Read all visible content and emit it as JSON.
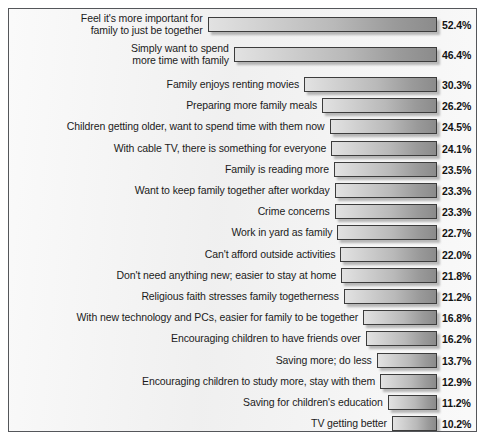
{
  "chart_data": {
    "type": "bar",
    "orientation": "horizontal",
    "title": "",
    "subtitle": "",
    "xlabel": "",
    "ylabel": "",
    "grid": false,
    "legend": null,
    "value_suffix": "%",
    "axis_alignment": "bars right-aligned to common right edge",
    "xlim": [
      0,
      52.4
    ],
    "categories": [
      "Feel it's more important for\nfamily to just be together",
      "Simply want to spend\nmore time with family",
      "Family enjoys renting movies",
      "Preparing more family meals",
      "Children getting older, want to spend time with them now",
      "With cable TV, there is something for everyone",
      "Family is reading more",
      "Want to keep family together after workday",
      "Crime concerns",
      "Work in yard as family",
      "Can't afford outside activities",
      "Don't need anything new; easier to stay at home",
      "Religious faith stresses family togetherness",
      "With new technology and PCs, easier for family to be together",
      "Encouraging children to have friends over",
      "Saving more; do less",
      "Encouraging children to study more, stay with them",
      "Saving for children's education",
      "TV getting better"
    ],
    "values": [
      52.4,
      46.4,
      30.3,
      26.2,
      24.5,
      24.1,
      23.5,
      23.3,
      23.3,
      22.7,
      22.0,
      21.8,
      21.2,
      16.8,
      16.2,
      13.7,
      12.9,
      11.2,
      10.2
    ],
    "value_labels": [
      "52.4%",
      "46.4%",
      "30.3%",
      "26.2%",
      "24.5%",
      "24.1%",
      "23.5%",
      "23.3%",
      "23.3%",
      "22.7%",
      "22.0%",
      "21.8%",
      "21.2%",
      "16.8%",
      "16.2%",
      "13.7%",
      "12.9%",
      "11.2%",
      "10.2%"
    ]
  },
  "style": {
    "frame_border_color": "#54565a",
    "background_color": "#f1f1f1",
    "bar_outline_color": "#3c3c3c",
    "bar_fill_light": "#e2e2e2",
    "bar_fill_dark": "#8b8b8b",
    "text_color": "#1b1b1b"
  }
}
